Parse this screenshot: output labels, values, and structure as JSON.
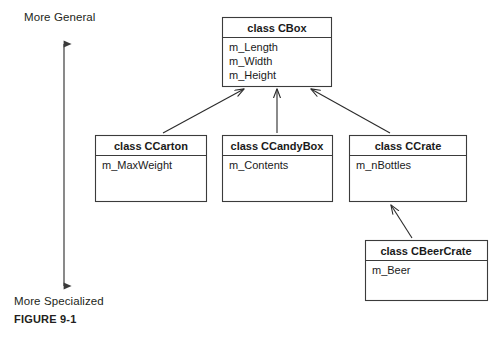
{
  "figure": {
    "caption": "FIGURE 9-1",
    "axis": {
      "top_label": "More General",
      "bottom_label": "More Specialized"
    }
  },
  "diagram": {
    "type": "uml-class-inheritance",
    "classes": [
      {
        "id": "cbox",
        "title": "class CBox",
        "attributes": [
          "m_Length",
          "m_Width",
          "m_Height"
        ],
        "x": 222,
        "y": 17,
        "width": 109,
        "height": 69,
        "header_height": 20
      },
      {
        "id": "ccarton",
        "title": "class CCarton",
        "attributes": [
          "m_MaxWeight"
        ],
        "x": 95,
        "y": 135,
        "width": 111,
        "height": 66,
        "header_height": 20
      },
      {
        "id": "ccandybox",
        "title": "class CCandyBox",
        "attributes": [
          "m_Contents"
        ],
        "x": 222,
        "y": 135,
        "width": 110,
        "height": 66,
        "header_height": 20
      },
      {
        "id": "ccrate",
        "title": "class CCrate",
        "attributes": [
          "m_nBottles"
        ],
        "x": 349,
        "y": 135,
        "width": 117,
        "height": 66,
        "header_height": 20
      },
      {
        "id": "cbeercrate",
        "title": "class CBeerCrate",
        "attributes": [
          "m_Beer"
        ],
        "x": 365,
        "y": 240,
        "width": 122,
        "height": 60,
        "header_height": 20
      }
    ],
    "relationships": [
      {
        "from": "ccarton",
        "to": "cbox",
        "kind": "inheritance"
      },
      {
        "from": "ccandybox",
        "to": "cbox",
        "kind": "inheritance"
      },
      {
        "from": "ccrate",
        "to": "cbox",
        "kind": "inheritance"
      },
      {
        "from": "cbeercrate",
        "to": "ccrate",
        "kind": "inheritance"
      }
    ]
  }
}
